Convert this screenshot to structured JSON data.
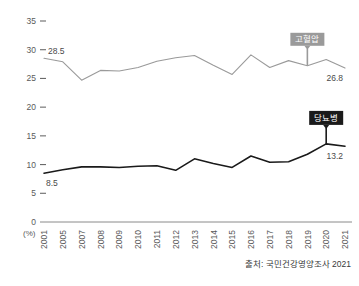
{
  "chart_data": {
    "type": "line",
    "title": "",
    "xlabel": "",
    "ylabel": "(%)",
    "unit_label": "(%)",
    "ylim": [
      0,
      35
    ],
    "y_ticks": [
      0,
      5,
      10,
      15,
      20,
      25,
      30,
      35
    ],
    "grid": false,
    "legend_position": "inline-callout",
    "categories": [
      "2001",
      "2005",
      "2007",
      "2008",
      "2009",
      "2010",
      "2011",
      "2012",
      "2013",
      "2014",
      "2015",
      "2016",
      "2017",
      "2018",
      "2019",
      "2020",
      "2021"
    ],
    "series": [
      {
        "name": "고혈압",
        "color": "#9a9a9a",
        "values": [
          28.5,
          27.9,
          24.7,
          26.4,
          26.3,
          26.9,
          28.0,
          28.6,
          29.0,
          27.3,
          25.7,
          29.1,
          26.9,
          28.1,
          27.2,
          28.3,
          26.8
        ],
        "start_label": "28.5",
        "end_label": "26.8"
      },
      {
        "name": "당뇨병",
        "color": "#1a1a1a",
        "values": [
          8.5,
          9.1,
          9.6,
          9.6,
          9.5,
          9.7,
          9.8,
          9.0,
          11.0,
          10.2,
          9.5,
          11.5,
          10.4,
          10.5,
          11.8,
          13.6,
          13.2
        ],
        "start_label": "8.5",
        "end_label": "13.2"
      }
    ],
    "callouts": [
      {
        "name": "hypertension-callout",
        "text": "고혈압",
        "bg": "#9a9a9a",
        "fg": "#ffffff",
        "anchor_index": 14
      },
      {
        "name": "diabetes-callout",
        "text": "당뇨병",
        "bg": "#1a1a1a",
        "fg": "#ffffff",
        "anchor_index": 15
      }
    ],
    "source": "출처: 국민건강영양조사 2021",
    "axis_color": "#6a6a6a"
  }
}
